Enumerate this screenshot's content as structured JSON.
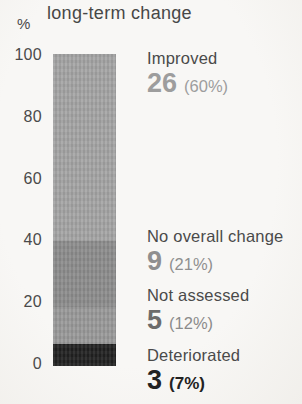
{
  "title": "long-term change",
  "axis": {
    "unit_label": "%"
  },
  "colors": {
    "background": "#f6f5f2",
    "label_text": "#4a4a4a"
  },
  "chart_data": {
    "type": "bar",
    "stacked": true,
    "title": "long-term change",
    "xlabel": "",
    "ylabel": "%",
    "ylim": [
      0,
      100
    ],
    "grid": false,
    "legend_position": "right",
    "ytick_labels": [
      "100",
      "80",
      "60",
      "40",
      "20",
      "0"
    ],
    "categories": [
      "Improved",
      "No overall change",
      "Not assessed",
      "Deteriorated"
    ],
    "values": [
      26,
      9,
      5,
      3
    ],
    "percents": [
      60,
      21,
      12,
      7
    ],
    "segment_colors": [
      "#a5a5a5",
      "#8d8d8d",
      "#9a9a9a",
      "#212121"
    ]
  },
  "annotations": [
    {
      "label": "Improved",
      "count": "26",
      "pct": "(60%)",
      "count_color": "#9d9d9d",
      "pct_color": "#9d9d9d"
    },
    {
      "label": "No overall change",
      "count": "9",
      "pct": "(21%)",
      "count_color": "#8f8f8f",
      "pct_color": "#8f8f8f"
    },
    {
      "label": "Not assessed",
      "count": "5",
      "pct": "(12%)",
      "count_color": "#6c6c6c",
      "pct_color": "#8b8b8b"
    },
    {
      "label": "Deteriorated",
      "count": "3",
      "pct": "(7%)",
      "count_color": "#222222",
      "pct_color": "#222222"
    }
  ]
}
